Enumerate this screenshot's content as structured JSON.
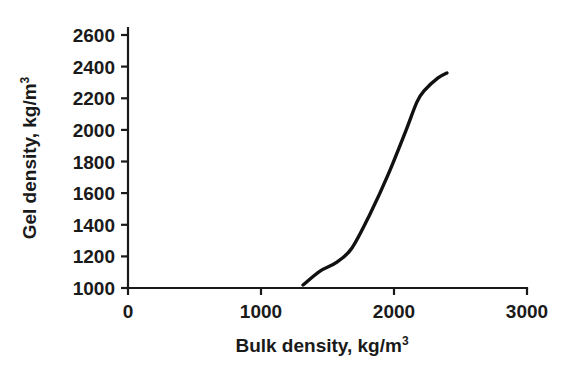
{
  "figure": {
    "background_color": "#ffffff",
    "line_color": "#111111",
    "axis_color": "#1a1a1a"
  },
  "chart_data": {
    "type": "line",
    "title": "",
    "subtitle": "",
    "xlabel_text": "Bulk density, kg/m",
    "xlabel_sup": "3",
    "ylabel_text": "Gel density, kg/m",
    "ylabel_sup": "3",
    "xlim": [
      0,
      3000
    ],
    "ylim": [
      1000,
      2600
    ],
    "xticks": [
      0,
      1000,
      2000,
      3000
    ],
    "xtick_labels": [
      "0",
      "1000",
      "2000",
      "3000"
    ],
    "yticks": [
      1000,
      1200,
      1400,
      1600,
      1800,
      2000,
      2200,
      2400,
      2600
    ],
    "ytick_labels": [
      "1000",
      "1200",
      "1400",
      "1600",
      "1800",
      "2000",
      "2200",
      "2400",
      "2600"
    ],
    "grid": false,
    "legend": null,
    "legend_position": "none",
    "annotations": [],
    "series": [
      {
        "name": "gel density vs bulk density",
        "color": "#111111",
        "x": [
          1316,
          1444,
          1571,
          1684,
          1820,
          1955,
          2083,
          2173,
          2233,
          2331,
          2398
        ],
        "y": [
          1019,
          1107,
          1164,
          1253,
          1468,
          1715,
          1981,
          2177,
          2253,
          2329,
          2360
        ]
      }
    ]
  }
}
